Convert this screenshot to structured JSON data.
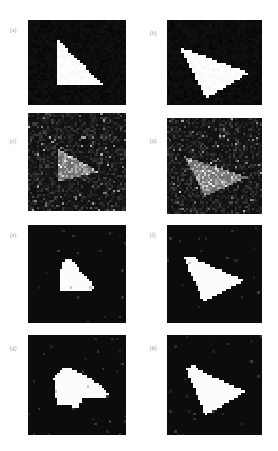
{
  "figure": {
    "caption_style": "lettered-subpanels",
    "width": 278,
    "height": 451,
    "background": "#ffffff",
    "panel_background": "#090909",
    "shape_color": "#ffffff",
    "columns": 2,
    "rows": 4
  },
  "panels": [
    {
      "id": "a",
      "label": "(a)",
      "kind": "binary",
      "description": "clean right triangle, vertical left edge, horizontal bottom edge, staircase hypotenuse",
      "x": 28,
      "y": 20,
      "w": 98,
      "h": 85,
      "label_x": 10,
      "label_y": 27,
      "noise": 0.0,
      "grid": 34,
      "polygon": [
        [
          0.3,
          0.22
        ],
        [
          0.3,
          0.76
        ],
        [
          0.76,
          0.76
        ]
      ]
    },
    {
      "id": "b",
      "label": "(b)",
      "kind": "binary",
      "description": "rotated sharp triangle pointing right",
      "x": 167,
      "y": 20,
      "w": 95,
      "h": 85,
      "label_x": 150,
      "label_y": 30,
      "noise": 0.0,
      "grid": 34,
      "polygon": [
        [
          0.14,
          0.32
        ],
        [
          0.87,
          0.62
        ],
        [
          0.41,
          0.92
        ]
      ]
    },
    {
      "id": "c",
      "label": "(c)",
      "kind": "noisy",
      "description": "noisy speckled version of panel a triangle, low contrast grey blob on dark speckle",
      "x": 28,
      "y": 113,
      "w": 98,
      "h": 98,
      "label_x": 10,
      "label_y": 138,
      "noise": 0.85,
      "grid": 46,
      "polygon": [
        [
          0.3,
          0.36
        ],
        [
          0.3,
          0.7
        ],
        [
          0.72,
          0.6
        ]
      ]
    },
    {
      "id": "d",
      "label": "(d)",
      "kind": "noisy",
      "description": "noisy speckled version of panel b triangle, grey blob on dark speckle",
      "x": 167,
      "y": 118,
      "w": 95,
      "h": 96,
      "label_x": 150,
      "label_y": 138,
      "noise": 0.85,
      "grid": 46,
      "polygon": [
        [
          0.18,
          0.4
        ],
        [
          0.84,
          0.62
        ],
        [
          0.4,
          0.82
        ]
      ]
    },
    {
      "id": "e",
      "label": "(e)",
      "kind": "binary",
      "description": "segmented blobby triangle, smaller, rounded top-left corner",
      "x": 28,
      "y": 225,
      "w": 98,
      "h": 98,
      "label_x": 10,
      "label_y": 232,
      "noise": 0.08,
      "grid": 40,
      "polygon": [
        [
          0.34,
          0.38
        ],
        [
          0.4,
          0.34
        ],
        [
          0.46,
          0.37
        ],
        [
          0.7,
          0.66
        ],
        [
          0.33,
          0.68
        ]
      ]
    },
    {
      "id": "f",
      "label": "(f)",
      "kind": "binary",
      "description": "segmented blobby triangle pointing right with flattened apex",
      "x": 167,
      "y": 225,
      "w": 95,
      "h": 98,
      "label_x": 150,
      "label_y": 232,
      "noise": 0.08,
      "grid": 40,
      "polygon": [
        [
          0.18,
          0.34
        ],
        [
          0.26,
          0.31
        ],
        [
          0.3,
          0.35
        ],
        [
          0.8,
          0.56
        ],
        [
          0.72,
          0.62
        ],
        [
          0.38,
          0.78
        ]
      ]
    },
    {
      "id": "g",
      "label": "(g)",
      "kind": "binary",
      "description": "segmented blob with a thin tail extending to the right",
      "x": 28,
      "y": 335,
      "w": 98,
      "h": 100,
      "label_x": 10,
      "label_y": 345,
      "noise": 0.1,
      "grid": 40,
      "polygon": [
        [
          0.26,
          0.44
        ],
        [
          0.36,
          0.32
        ],
        [
          0.46,
          0.34
        ],
        [
          0.7,
          0.47
        ],
        [
          0.82,
          0.57
        ],
        [
          0.8,
          0.63
        ],
        [
          0.56,
          0.63
        ],
        [
          0.52,
          0.72
        ],
        [
          0.3,
          0.7
        ]
      ]
    },
    {
      "id": "h",
      "label": "(h)",
      "kind": "binary",
      "description": "segmented blobby triangle pointing right, similar to f with thinner tail",
      "x": 167,
      "y": 335,
      "w": 95,
      "h": 100,
      "label_x": 150,
      "label_y": 345,
      "noise": 0.1,
      "grid": 40,
      "polygon": [
        [
          0.2,
          0.33
        ],
        [
          0.28,
          0.3
        ],
        [
          0.32,
          0.34
        ],
        [
          0.82,
          0.56
        ],
        [
          0.74,
          0.62
        ],
        [
          0.4,
          0.8
        ]
      ]
    }
  ]
}
